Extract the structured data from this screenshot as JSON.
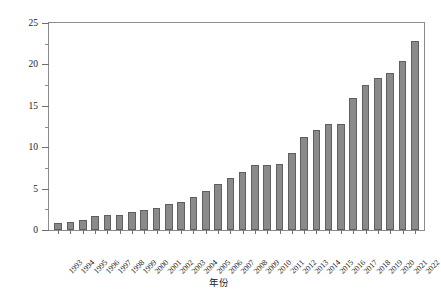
{
  "chart_data": {
    "type": "bar",
    "title": "",
    "xlabel": "年份",
    "ylabel": "建筑固废年产生量/亿t",
    "ylim": [
      0,
      25
    ],
    "yticks": [
      0,
      5,
      10,
      15,
      20,
      25
    ],
    "ytick_labels": [
      "0",
      "5",
      "10",
      "15",
      "20",
      "25"
    ],
    "grid": false,
    "legend": null,
    "bar_color": "#8a8a8a",
    "bar_edge_color": "#5f5f5f",
    "axis_color": "#8c8c8c",
    "categories": [
      "1993",
      "1994",
      "1995",
      "1996",
      "1997",
      "1998",
      "1999",
      "2000",
      "2001",
      "2002",
      "2003",
      "2004",
      "2005",
      "2006",
      "2007",
      "2008",
      "2009",
      "2010",
      "2011",
      "2012",
      "2013",
      "2014",
      "2015",
      "2016",
      "2017",
      "2018",
      "2019",
      "2020",
      "2021",
      "2022"
    ],
    "values": [
      0.8,
      1.0,
      1.2,
      1.7,
      1.8,
      1.8,
      2.2,
      2.4,
      2.6,
      3.1,
      3.4,
      4.0,
      4.7,
      5.5,
      6.3,
      7.0,
      7.8,
      7.8,
      8.0,
      9.3,
      11.2,
      12.1,
      12.8,
      12.8,
      16.0,
      17.5,
      18.3,
      19.0,
      20.4,
      22.8
    ]
  }
}
